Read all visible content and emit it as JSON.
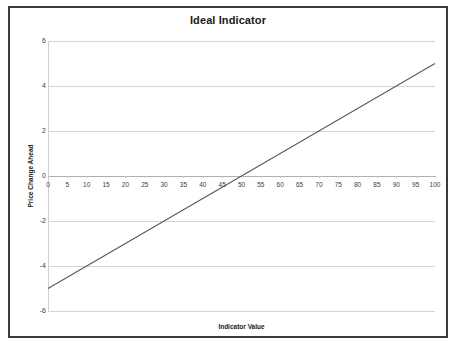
{
  "chart_data": {
    "type": "line",
    "title": "Ideal Indicator",
    "xlabel": "Indicator Value",
    "ylabel": "Price Change Ahead",
    "xlim": [
      0,
      100
    ],
    "ylim": [
      -6,
      6
    ],
    "grid": true,
    "legend": "none",
    "x_ticks": [
      0,
      5,
      10,
      15,
      20,
      25,
      30,
      35,
      40,
      45,
      50,
      55,
      60,
      65,
      70,
      75,
      80,
      85,
      90,
      95,
      100
    ],
    "y_ticks": [
      6,
      4,
      2,
      0,
      -2,
      -4,
      -6
    ],
    "series": [
      {
        "name": "Ideal Indicator",
        "color": "#595959",
        "x": [
          0,
          5,
          10,
          15,
          20,
          25,
          30,
          35,
          40,
          45,
          50,
          55,
          60,
          65,
          70,
          75,
          80,
          85,
          90,
          95,
          100
        ],
        "values": [
          -5,
          -4.5,
          -4,
          -3.5,
          -3,
          -2.5,
          -2,
          -1.5,
          -1,
          -0.5,
          0,
          0.5,
          1,
          1.5,
          2,
          2.5,
          3,
          3.5,
          4,
          4.5,
          5
        ]
      }
    ]
  },
  "style": {
    "frame_border_color": "#3a3a3a",
    "gridline_color": "#d4d4d4",
    "zero_axis_color": "#b0b0b0",
    "tick_text_color": "#3d3d3d",
    "title_color": "#1a1a1a",
    "plot_background": "#ffffff"
  }
}
